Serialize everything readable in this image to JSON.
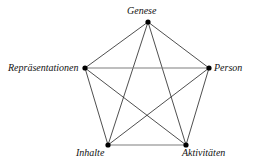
{
  "diagram": {
    "type": "pentagram-complete-graph",
    "background_color": "#ffffff",
    "edge_color": "#222222",
    "edge_color_light": "#7f7f7f",
    "node_color": "#000000",
    "nodes": [
      {
        "id": "genese",
        "label": "Genese",
        "x": 148,
        "y": 22
      },
      {
        "id": "person",
        "label": "Person",
        "x": 209,
        "y": 68
      },
      {
        "id": "aktivitaeten",
        "label": "Aktivitäten",
        "x": 186,
        "y": 145
      },
      {
        "id": "inhalte",
        "label": "Inhalte",
        "x": 108,
        "y": 145
      },
      {
        "id": "repraesentationen",
        "label": "Repräsentationen",
        "x": 85,
        "y": 68
      }
    ],
    "edges": [
      {
        "from": "genese",
        "to": "person",
        "style": "dark"
      },
      {
        "from": "person",
        "to": "aktivitaeten",
        "style": "dark"
      },
      {
        "from": "aktivitaeten",
        "to": "inhalte",
        "style": "light"
      },
      {
        "from": "inhalte",
        "to": "repraesentationen",
        "style": "dark"
      },
      {
        "from": "repraesentationen",
        "to": "genese",
        "style": "dark"
      },
      {
        "from": "genese",
        "to": "aktivitaeten",
        "style": "dark"
      },
      {
        "from": "genese",
        "to": "inhalte",
        "style": "dark"
      },
      {
        "from": "person",
        "to": "inhalte",
        "style": "dark"
      },
      {
        "from": "person",
        "to": "repraesentationen",
        "style": "light"
      },
      {
        "from": "aktivitaeten",
        "to": "repraesentationen",
        "style": "dark"
      }
    ]
  }
}
